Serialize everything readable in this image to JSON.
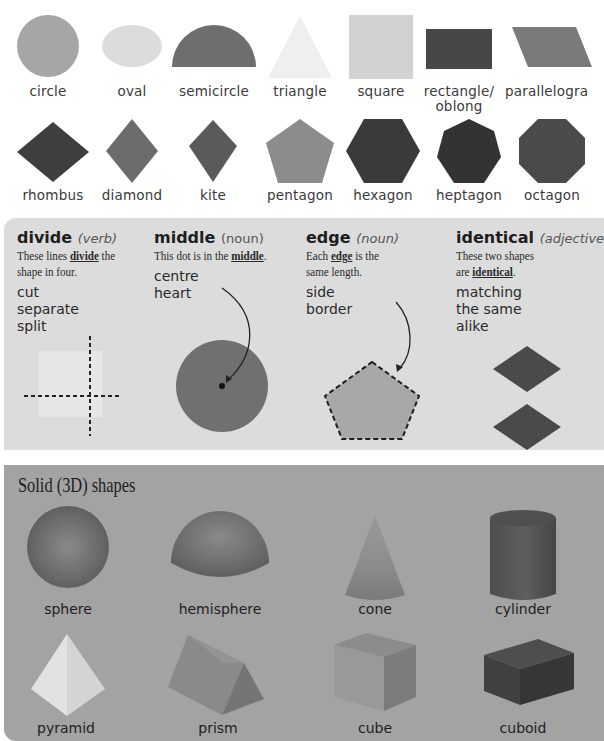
{
  "plane_shapes": {
    "row1": [
      {
        "name": "circle",
        "color": "#a6a6a6"
      },
      {
        "name": "oval",
        "color": "#dcdcdc"
      },
      {
        "name": "semicircle",
        "color": "#6e6e6e"
      },
      {
        "name": "triangle",
        "color": "#efefef"
      },
      {
        "name": "square",
        "color": "#d2d2d2"
      },
      {
        "name": "rectangle/",
        "name_line2": "oblong",
        "color": "#474747"
      },
      {
        "name": "parallelogra",
        "color": "#7a7a7a"
      }
    ],
    "row2": [
      {
        "name": "rhombus",
        "color": "#3e3e3e"
      },
      {
        "name": "diamond",
        "color": "#6c6c6c"
      },
      {
        "name": "kite",
        "color": "#5a5a5a"
      },
      {
        "name": "pentagon",
        "color": "#8c8c8c"
      },
      {
        "name": "hexagon",
        "color": "#3a3a3a"
      },
      {
        "name": "heptagon",
        "color": "#333333"
      },
      {
        "name": "octagon",
        "color": "#4a4a4a"
      }
    ]
  },
  "vocabulary": [
    {
      "word": "divide",
      "part_of_speech": "(verb)",
      "sentence_parts": [
        "These lines ",
        "divide",
        " the"
      ],
      "sentence_line2": "shape in four.",
      "synonyms": [
        "cut",
        "separate",
        "split"
      ]
    },
    {
      "word": "middle",
      "part_of_speech": "(noun)",
      "sentence_parts": [
        "This dot is in the ",
        "middle",
        "."
      ],
      "synonyms": [
        "centre",
        "heart"
      ]
    },
    {
      "word": "edge",
      "part_of_speech": "(noun)",
      "sentence_parts": [
        "Each ",
        "edge",
        " is the"
      ],
      "sentence_line2": "same length.",
      "synonyms": [
        "side",
        "border"
      ]
    },
    {
      "word": "identical",
      "part_of_speech": "(adjective",
      "sentence_line1": "These two shapes",
      "sentence_parts": [
        "are ",
        "identical",
        "."
      ],
      "synonyms": [
        "matching",
        "the same",
        "alike"
      ]
    }
  ],
  "solid_shapes": {
    "title": "Solid (3D) shapes",
    "row1": [
      "sphere",
      "hemisphere",
      "cone",
      "cylinder"
    ],
    "row2": [
      "pyramid",
      "prism",
      "cube",
      "cuboid"
    ]
  },
  "colors": {
    "page_bg": "#ffffff",
    "vocab_panel": "#dcdcdc",
    "solid_panel": "#a3a3a3"
  }
}
